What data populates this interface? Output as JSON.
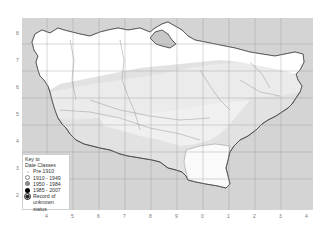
{
  "map": {
    "region": "county outline map with grid",
    "background_sea_color": "#d4d4d4",
    "land_zones": [
      {
        "name": "white-zone",
        "color": "#ffffff"
      },
      {
        "name": "light-grey-zone",
        "color": "#ececec"
      },
      {
        "name": "mid-grey-zone",
        "color": "#e0e0e0"
      }
    ]
  },
  "legend": {
    "title_line1": "Key to",
    "title_line2": "Date Classes",
    "items": [
      {
        "label": "Pre 1910",
        "symbol": "tiny-dot",
        "color": "#d8d8d8"
      },
      {
        "label": "1910 - 1949",
        "symbol": "open-circle",
        "color": "#ffffff"
      },
      {
        "label": "1950 - 1984",
        "symbol": "grey-circle",
        "color": "#8a8a8a"
      },
      {
        "label": "1985 - 2007",
        "symbol": "black-circle",
        "color": "#000000"
      },
      {
        "label": "Record of",
        "label2": "unknown status",
        "symbol": "dotted-circle",
        "color": "#222222"
      }
    ]
  },
  "axes": {
    "x_ticks": [
      "4",
      "5",
      "6",
      "7",
      "8",
      "9",
      "0",
      "1",
      "2",
      "3",
      "4"
    ],
    "y_ticks": [
      "8",
      "7",
      "6",
      "5",
      "4",
      "3",
      "2"
    ]
  }
}
